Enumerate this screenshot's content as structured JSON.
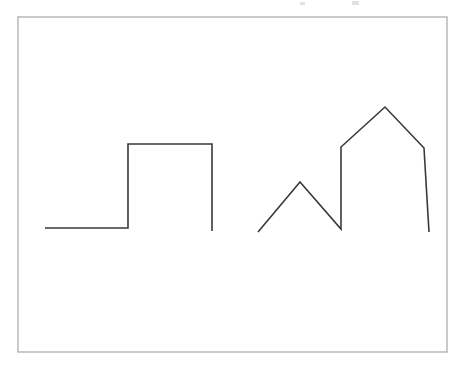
{
  "canvas": {
    "width": 464,
    "height": 374,
    "background_color": "#ffffff",
    "title": "line-drawing-canvas"
  },
  "frame": {
    "name": "border-rectangle",
    "x": 18,
    "y": 17,
    "width": 429,
    "height": 335,
    "stroke_color": "#b3b3b3",
    "stroke_width": 1.4
  },
  "drawings": [
    {
      "id": "step-polyline",
      "label": "Square step polyline",
      "stroke_color": "#3a3a3a",
      "stroke_width": 1.6,
      "closed": false,
      "points": [
        [
          45,
          228
        ],
        [
          128,
          228
        ],
        [
          128,
          144
        ],
        [
          212,
          144
        ],
        [
          212,
          231
        ]
      ]
    },
    {
      "id": "zigzag-diamond-polyline",
      "label": "Zigzag into diamond with crossing tail",
      "stroke_color": "#3a3a3a",
      "stroke_width": 1.6,
      "closed": false,
      "points": [
        [
          258,
          232
        ],
        [
          300,
          182
        ],
        [
          341,
          229
        ],
        [
          341,
          147
        ],
        [
          385,
          107
        ],
        [
          424,
          148
        ],
        [
          429,
          232
        ]
      ]
    }
  ],
  "specks": [
    {
      "name": "artifact-speck-1",
      "x": 300,
      "y": 2,
      "width": 5,
      "height": 3
    },
    {
      "name": "artifact-speck-2",
      "x": 352,
      "y": 1,
      "width": 7,
      "height": 4
    }
  ],
  "chart_data": {
    "type": "line",
    "title": "",
    "xlabel": "",
    "ylabel": "",
    "xlim": [
      0,
      464
    ],
    "ylim": [
      374,
      0
    ],
    "grid": false,
    "legend": "none",
    "series": [
      {
        "name": "step-polyline",
        "x": [
          45,
          128,
          128,
          212,
          212
        ],
        "y": [
          228,
          228,
          144,
          144,
          231
        ]
      },
      {
        "name": "zigzag-diamond-polyline",
        "x": [
          258,
          300,
          341,
          341,
          385,
          424,
          429
        ],
        "y": [
          232,
          182,
          229,
          147,
          107,
          148,
          232
        ]
      }
    ]
  }
}
